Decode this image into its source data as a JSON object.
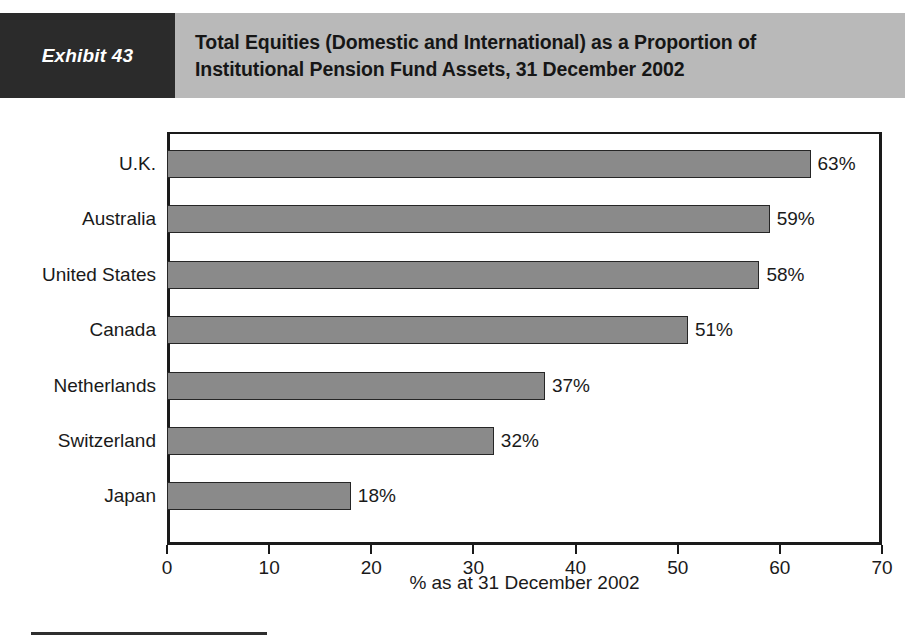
{
  "exhibit": {
    "tag_label": "Exhibit 43",
    "title_line_1": "Total Equities (Domestic and International) as a Proportion of",
    "title_line_2": "Institutional Pension Fund Assets, 31 December 2002",
    "tag_background": "#2b2b2b",
    "band_background": "#b9b9b9"
  },
  "chart_data": {
    "type": "bar",
    "orientation": "horizontal",
    "title": "Total Equities (Domestic and International) as a Proportion of Institutional Pension Fund Assets, 31 December 2002",
    "categories": [
      "U.K.",
      "Australia",
      "United States",
      "Canada",
      "Netherlands",
      "Switzerland",
      "Japan"
    ],
    "values": [
      63,
      59,
      58,
      51,
      37,
      32,
      18
    ],
    "value_labels": [
      "63%",
      "59%",
      "58%",
      "51%",
      "37%",
      "32%",
      "18%"
    ],
    "xlabel": "% as at 31 December 2002",
    "ylabel": "",
    "xlim": [
      0,
      70
    ],
    "xticks": [
      0,
      10,
      20,
      30,
      40,
      50,
      60,
      70
    ],
    "xtick_labels": [
      "0",
      "10",
      "20",
      "30",
      "40",
      "50",
      "60",
      "70"
    ],
    "grid": false,
    "legend": false,
    "bar_color": "#8a8a8a",
    "bar_border_color": "#262626",
    "axis_color": "#1a1a1a"
  }
}
